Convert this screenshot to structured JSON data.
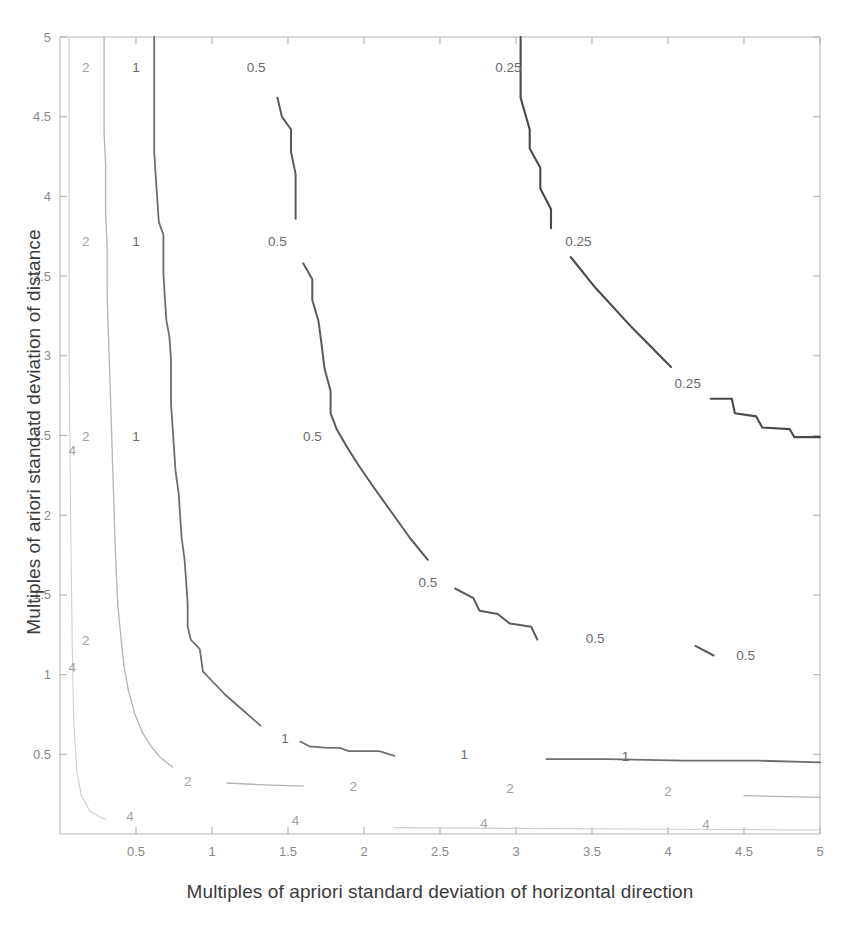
{
  "figure": {
    "background_color": "#ffffff",
    "frame_color": "#b9b9b9"
  },
  "chart_data": {
    "type": "line",
    "title": "",
    "xlabel": "Multiples of apriori standard deviation of horizontal direction",
    "ylabel": "Multiples of ariori standatd deviation of distance",
    "xlim": [
      0,
      5
    ],
    "ylim": [
      0,
      5
    ],
    "grid": false,
    "legend": "none",
    "xticks": [
      0.5,
      1,
      1.5,
      2,
      2.5,
      3,
      3.5,
      4,
      4.5,
      5
    ],
    "xticklabels": [
      "0.5",
      "1",
      "1.5",
      "2",
      "2.5",
      "3",
      "3.5",
      "4",
      "4.5",
      "5"
    ],
    "yticks": [
      0.5,
      1,
      1.5,
      2,
      2.5,
      3,
      3.5,
      4,
      4.5,
      5
    ],
    "yticklabels": [
      "0.5",
      "1",
      "1.5",
      "2",
      "2.5",
      "3",
      "3.5",
      "4",
      "4.5",
      "5"
    ],
    "contour_levels": [
      0.25,
      0.5,
      1,
      2,
      4
    ],
    "series": [
      {
        "name": "0.25",
        "level": 0.25,
        "label": "0.25",
        "color": "#4a4a4a",
        "points": [
          [
            3.03,
            5.0
          ],
          [
            3.03,
            4.62
          ],
          [
            3.09,
            4.42
          ],
          [
            3.09,
            4.3
          ],
          [
            3.16,
            4.18
          ],
          [
            3.16,
            4.05
          ],
          [
            3.23,
            3.92
          ],
          [
            3.23,
            3.8
          ],
          [
            3.3,
            3.7
          ],
          [
            3.36,
            3.62
          ],
          [
            3.52,
            3.43
          ],
          [
            3.76,
            3.18
          ],
          [
            4.02,
            2.93
          ],
          [
            4.18,
            2.78
          ],
          [
            4.28,
            2.73
          ],
          [
            4.42,
            2.73
          ],
          [
            4.44,
            2.64
          ],
          [
            4.58,
            2.62
          ],
          [
            4.62,
            2.55
          ],
          [
            4.8,
            2.54
          ],
          [
            4.83,
            2.49
          ],
          [
            5.0,
            2.49
          ]
        ]
      },
      {
        "name": "0.5",
        "level": 0.5,
        "label": "0.5",
        "color": "#5b5b5b",
        "points": [
          [
            1.38,
            5.0
          ],
          [
            1.38,
            4.76
          ],
          [
            1.43,
            4.62
          ],
          [
            1.46,
            4.5
          ],
          [
            1.52,
            4.42
          ],
          [
            1.52,
            4.28
          ],
          [
            1.55,
            4.14
          ],
          [
            1.55,
            3.86
          ],
          [
            1.56,
            3.72
          ],
          [
            1.6,
            3.58
          ],
          [
            1.66,
            3.48
          ],
          [
            1.66,
            3.35
          ],
          [
            1.7,
            3.22
          ],
          [
            1.72,
            3.08
          ],
          [
            1.74,
            2.92
          ],
          [
            1.78,
            2.78
          ],
          [
            1.78,
            2.64
          ],
          [
            1.82,
            2.54
          ],
          [
            1.88,
            2.44
          ],
          [
            1.96,
            2.32
          ],
          [
            2.06,
            2.18
          ],
          [
            2.18,
            2.02
          ],
          [
            2.3,
            1.86
          ],
          [
            2.42,
            1.72
          ],
          [
            2.5,
            1.62
          ],
          [
            2.6,
            1.54
          ],
          [
            2.72,
            1.48
          ],
          [
            2.76,
            1.4
          ],
          [
            2.88,
            1.38
          ],
          [
            2.96,
            1.32
          ],
          [
            3.1,
            1.3
          ],
          [
            3.14,
            1.22
          ],
          [
            3.46,
            1.21
          ],
          [
            3.5,
            1.18
          ],
          [
            4.18,
            1.18
          ],
          [
            4.3,
            1.12
          ],
          [
            4.44,
            1.09
          ],
          [
            4.62,
            1.08
          ],
          [
            5.0,
            1.08
          ]
        ]
      },
      {
        "name": "1",
        "level": 1,
        "label": "1",
        "color": "#6e6e6e",
        "points": [
          [
            0.62,
            5.0
          ],
          [
            0.62,
            4.28
          ],
          [
            0.63,
            4.12
          ],
          [
            0.64,
            3.98
          ],
          [
            0.65,
            3.84
          ],
          [
            0.68,
            3.76
          ],
          [
            0.68,
            3.52
          ],
          [
            0.69,
            3.36
          ],
          [
            0.7,
            3.22
          ],
          [
            0.72,
            3.12
          ],
          [
            0.73,
            2.98
          ],
          [
            0.73,
            2.7
          ],
          [
            0.74,
            2.56
          ],
          [
            0.75,
            2.42
          ],
          [
            0.76,
            2.28
          ],
          [
            0.78,
            2.14
          ],
          [
            0.79,
            2.0
          ],
          [
            0.8,
            1.86
          ],
          [
            0.82,
            1.72
          ],
          [
            0.83,
            1.58
          ],
          [
            0.84,
            1.44
          ],
          [
            0.84,
            1.3
          ],
          [
            0.86,
            1.22
          ],
          [
            0.92,
            1.16
          ],
          [
            0.94,
            1.02
          ],
          [
            1.0,
            0.96
          ],
          [
            1.08,
            0.88
          ],
          [
            1.2,
            0.78
          ],
          [
            1.32,
            0.68
          ],
          [
            1.4,
            0.62
          ],
          [
            1.52,
            0.6
          ],
          [
            1.58,
            0.58
          ],
          [
            1.64,
            0.55
          ],
          [
            1.76,
            0.54
          ],
          [
            1.84,
            0.54
          ],
          [
            1.9,
            0.52
          ],
          [
            2.1,
            0.52
          ],
          [
            2.2,
            0.49
          ],
          [
            2.58,
            0.48
          ],
          [
            2.7,
            0.47
          ],
          [
            3.2,
            0.47
          ],
          [
            3.6,
            0.47
          ],
          [
            4.1,
            0.46
          ],
          [
            4.6,
            0.46
          ],
          [
            5.0,
            0.45
          ]
        ]
      },
      {
        "name": "2",
        "level": 2,
        "label": "2",
        "color": "#b4b4b4",
        "points": [
          [
            0.29,
            5.0
          ],
          [
            0.29,
            4.4
          ],
          [
            0.3,
            4.2
          ],
          [
            0.3,
            3.9
          ],
          [
            0.31,
            3.68
          ],
          [
            0.31,
            3.4
          ],
          [
            0.32,
            3.1
          ],
          [
            0.33,
            2.8
          ],
          [
            0.34,
            2.5
          ],
          [
            0.35,
            2.2
          ],
          [
            0.36,
            1.9
          ],
          [
            0.37,
            1.64
          ],
          [
            0.38,
            1.44
          ],
          [
            0.4,
            1.24
          ],
          [
            0.42,
            1.06
          ],
          [
            0.45,
            0.9
          ],
          [
            0.49,
            0.76
          ],
          [
            0.54,
            0.64
          ],
          [
            0.6,
            0.55
          ],
          [
            0.66,
            0.48
          ],
          [
            0.74,
            0.42
          ],
          [
            0.82,
            0.38
          ],
          [
            0.92,
            0.35
          ],
          [
            1.1,
            0.32
          ],
          [
            1.3,
            0.31
          ],
          [
            1.6,
            0.3
          ],
          [
            2.0,
            0.29
          ],
          [
            2.5,
            0.28
          ],
          [
            3.0,
            0.27
          ],
          [
            3.5,
            0.26
          ],
          [
            4.0,
            0.25
          ],
          [
            4.5,
            0.24
          ],
          [
            5.0,
            0.23
          ]
        ]
      },
      {
        "name": "4",
        "level": 4,
        "label": "4",
        "color": "#cfcfcf",
        "points": [
          [
            0.06,
            5.0
          ],
          [
            0.06,
            3.0
          ],
          [
            0.07,
            2.0
          ],
          [
            0.08,
            1.2
          ],
          [
            0.09,
            0.7
          ],
          [
            0.11,
            0.4
          ],
          [
            0.14,
            0.24
          ],
          [
            0.2,
            0.14
          ],
          [
            0.3,
            0.09
          ],
          [
            0.5,
            0.06
          ],
          [
            0.9,
            0.05
          ],
          [
            1.5,
            0.045
          ],
          [
            2.2,
            0.04
          ],
          [
            3.0,
            0.035
          ],
          [
            4.0,
            0.03
          ],
          [
            5.0,
            0.025
          ]
        ]
      }
    ],
    "inline_labels": [
      {
        "text": "2",
        "x": 0.17,
        "y": 4.81,
        "style": "faint"
      },
      {
        "text": "1",
        "x": 0.5,
        "y": 4.81,
        "style": "normal"
      },
      {
        "text": "0.5",
        "x": 1.29,
        "y": 4.81,
        "style": "normal"
      },
      {
        "text": "0.25",
        "x": 2.95,
        "y": 4.81,
        "style": "normal"
      },
      {
        "text": "2",
        "x": 0.17,
        "y": 3.72,
        "style": "faint"
      },
      {
        "text": "1",
        "x": 0.5,
        "y": 3.72,
        "style": "normal"
      },
      {
        "text": "0.5",
        "x": 1.43,
        "y": 3.72,
        "style": "normal"
      },
      {
        "text": "0.25",
        "x": 3.41,
        "y": 3.72,
        "style": "normal"
      },
      {
        "text": "0.25",
        "x": 4.13,
        "y": 2.83,
        "style": "normal"
      },
      {
        "text": "2",
        "x": 0.17,
        "y": 2.5,
        "style": "faint"
      },
      {
        "text": "1",
        "x": 0.5,
        "y": 2.5,
        "style": "normal"
      },
      {
        "text": "0.5",
        "x": 1.66,
        "y": 2.5,
        "style": "normal"
      },
      {
        "text": "0.5",
        "x": 2.42,
        "y": 1.58,
        "style": "normal"
      },
      {
        "text": "0.5",
        "x": 3.52,
        "y": 1.23,
        "style": "normal"
      },
      {
        "text": "0.5",
        "x": 4.51,
        "y": 1.12,
        "style": "normal"
      },
      {
        "text": "2",
        "x": 0.17,
        "y": 1.22,
        "style": "faint"
      },
      {
        "text": "4",
        "x": 0.08,
        "y": 1.05,
        "style": "faint"
      },
      {
        "text": "4",
        "x": 0.08,
        "y": 2.41,
        "style": "faint"
      },
      {
        "text": "1",
        "x": 1.48,
        "y": 0.6,
        "style": "normal"
      },
      {
        "text": "1",
        "x": 2.66,
        "y": 0.5,
        "style": "normal"
      },
      {
        "text": "1",
        "x": 3.72,
        "y": 0.49,
        "style": "normal"
      },
      {
        "text": "2",
        "x": 0.84,
        "y": 0.33,
        "style": "faint"
      },
      {
        "text": "2",
        "x": 1.93,
        "y": 0.3,
        "style": "faint"
      },
      {
        "text": "2",
        "x": 2.96,
        "y": 0.29,
        "style": "faint"
      },
      {
        "text": "2",
        "x": 4.0,
        "y": 0.27,
        "style": "faint"
      },
      {
        "text": "4",
        "x": 0.46,
        "y": 0.11,
        "style": "faint"
      },
      {
        "text": "4",
        "x": 1.55,
        "y": 0.09,
        "style": "faint"
      },
      {
        "text": "4",
        "x": 2.79,
        "y": 0.07,
        "style": "faint"
      },
      {
        "text": "4",
        "x": 4.25,
        "y": 0.06,
        "style": "faint"
      }
    ]
  }
}
